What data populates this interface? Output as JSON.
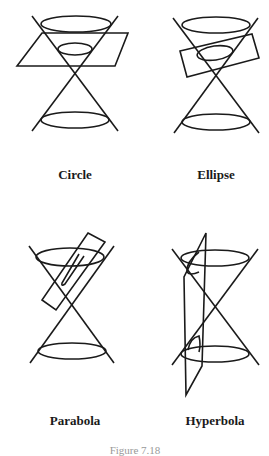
{
  "figure": {
    "panels": [
      {
        "id": "circle",
        "label": "Circle",
        "label_pos": [
          75,
          174
        ]
      },
      {
        "id": "ellipse",
        "label": "Ellipse",
        "label_pos": [
          216,
          174
        ]
      },
      {
        "id": "parabola",
        "label": "Parabola",
        "label_pos": [
          75,
          421
        ]
      },
      {
        "id": "hyperbola",
        "label": "Hyperbola",
        "label_pos": [
          215,
          421
        ]
      }
    ],
    "caption": "Figure 7.18",
    "stroke_color": "#1a1a1a"
  }
}
